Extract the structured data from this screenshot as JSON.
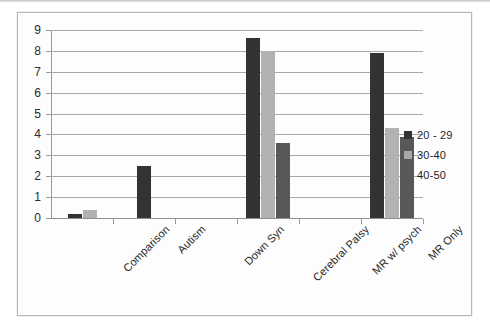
{
  "chart_data": {
    "type": "bar",
    "title": "",
    "subtitle": "",
    "xlabel": "",
    "ylabel": "",
    "ylim": [
      0,
      9
    ],
    "ytick_step": 1,
    "yticks": [
      "9",
      "8",
      "7",
      "6",
      "5",
      "4",
      "3",
      "2",
      "1",
      "0"
    ],
    "grid": true,
    "grid_orientation": "horizontal",
    "legend_position": "right",
    "categories": [
      "Comparison",
      "Autism",
      "Down Syn",
      "Cerebral Palsy",
      "MR w/ psych",
      "MR Only"
    ],
    "series": [
      {
        "name": "20 - 29",
        "color": "#333333",
        "values": [
          0.2,
          2.5,
          0,
          8.6,
          0,
          7.9
        ]
      },
      {
        "name": "30-40",
        "color": "#b2b2b2",
        "values": [
          0.4,
          0,
          0,
          8.0,
          0,
          4.3
        ]
      },
      {
        "name": "40-50",
        "color": "#585858",
        "values": [
          0,
          0,
          0,
          3.6,
          0,
          3.9
        ]
      }
    ]
  },
  "legend": {
    "items": [
      {
        "label": "20 - 29",
        "swatch": "#333333"
      },
      {
        "label": "30-40",
        "swatch": "#a8a8a8"
      },
      {
        "label": "40-50",
        "swatch": "#585858"
      }
    ]
  },
  "colors": {
    "frame_border": "#b6b6b6",
    "gridline": "#a9a9a9",
    "axis": "#9a9a9a",
    "text": "#262626",
    "background": "#fdfdfd"
  }
}
